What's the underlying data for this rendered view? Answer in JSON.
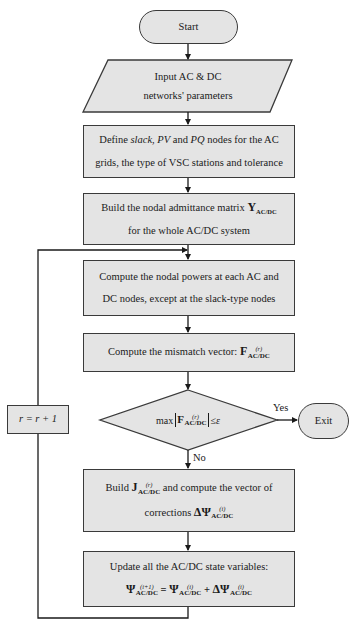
{
  "flowchart": {
    "start": {
      "label": "Start"
    },
    "input": {
      "line1": "Input AC & DC",
      "line2": "networks' parameters"
    },
    "define": {
      "line1_pre": "Define ",
      "line1_slack": "slack",
      "line1_mid1": ", ",
      "line1_pv": "PV",
      "line1_mid2": " and ",
      "line1_pq": "PQ",
      "line1_post": " nodes for the AC",
      "line2": "grids, the type of VSC stations and tolerance"
    },
    "admittance": {
      "line1_pre": "Build the nodal admittance matrix ",
      "symbol": "Y",
      "subscript": "AC/DC",
      "line2": "for the whole AC/DC system"
    },
    "powers": {
      "line1": "Compute the nodal powers at each AC and",
      "line2": "DC nodes, except at the slack-type nodes"
    },
    "mismatch": {
      "pre": "Compute the mismatch vector: ",
      "symbol": "F",
      "superscript": "(r)",
      "subscript": "AC/DC"
    },
    "decision": {
      "pre": "max",
      "symbol": "F",
      "superscript": "(r)",
      "subscript": "AC/DC",
      "post": "≤ε",
      "yes_label": "Yes",
      "no_label": "No"
    },
    "exit": {
      "label": "Exit"
    },
    "jacobian": {
      "line1_pre": "Build ",
      "symbol": "J",
      "superscript": "(r)",
      "subscript": "AC/DC",
      "line1_post": " and compute the vector of",
      "line2_pre": "corrections ",
      "delta_symbol": "ΔΨ",
      "delta_superscript": "(i)",
      "delta_subscript": "AC/DC"
    },
    "update": {
      "line1": "Update all the AC/DC state variables:",
      "lhs_symbol": "Ψ",
      "lhs_superscript": "(i+1)",
      "lhs_subscript": "AC/DC",
      "eq": " = ",
      "rhs1_symbol": "Ψ",
      "rhs1_superscript": "(i)",
      "rhs1_subscript": "AC/DC",
      "plus": " + ",
      "rhs2_symbol": "ΔΨ",
      "rhs2_superscript": "(i)",
      "rhs2_subscript": "AC/DC"
    },
    "loop": {
      "label": "r = r + 1"
    }
  },
  "colors": {
    "fill": "#e4e4e4",
    "stroke": "#3a3a3a",
    "background": "#ffffff"
  }
}
